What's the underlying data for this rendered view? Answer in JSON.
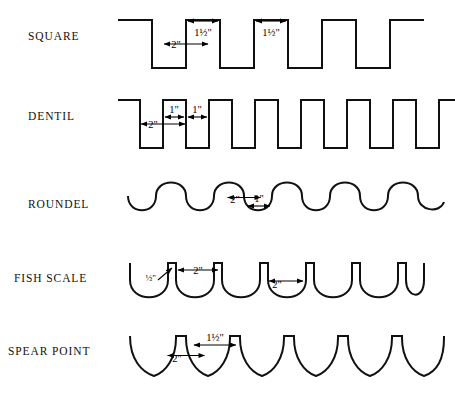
{
  "figure": {
    "background_color": "#ffffff",
    "line_color": "#111111",
    "width": 455,
    "height": 408,
    "type": "technical-profile-diagram"
  },
  "rows": [
    {
      "id": "square",
      "label": "SQUARE",
      "profile": "square-wave",
      "dimensions": [
        {
          "id": "square-depth",
          "value": "2\"",
          "orientation": "vertical",
          "meaning": "depth of cut"
        },
        {
          "id": "square-width-1",
          "value": "1½\"",
          "orientation": "horizontal",
          "meaning": "notch width"
        },
        {
          "id": "square-width-2",
          "value": "1½\"",
          "orientation": "horizontal",
          "meaning": "tooth width"
        }
      ]
    },
    {
      "id": "dentil",
      "label": "DENTIL",
      "profile": "square-wave-narrow",
      "dimensions": [
        {
          "id": "dentil-depth",
          "value": "2\"",
          "orientation": "vertical",
          "meaning": "depth of cut"
        },
        {
          "id": "dentil-width-1",
          "value": "1\"",
          "orientation": "horizontal",
          "meaning": "notch width"
        },
        {
          "id": "dentil-width-2",
          "value": "1\"",
          "orientation": "horizontal",
          "meaning": "tooth width"
        }
      ]
    },
    {
      "id": "roundel",
      "label": "ROUNDEL",
      "profile": "scalloped-wave",
      "dimensions": [
        {
          "id": "roundel-depth",
          "value": "2\"",
          "orientation": "vertical",
          "meaning": "depth of cut"
        },
        {
          "id": "roundel-width",
          "value": "1\"",
          "orientation": "horizontal",
          "meaning": "valley width"
        }
      ]
    },
    {
      "id": "fish-scale",
      "label": "FISH SCALE",
      "profile": "u-scallop",
      "dimensions": [
        {
          "id": "fish-scale-tip",
          "value": "½\"",
          "orientation": "leader",
          "meaning": "flat top width"
        },
        {
          "id": "fish-scale-width",
          "value": "2\"",
          "orientation": "horizontal",
          "meaning": "scallop width"
        },
        {
          "id": "fish-scale-depth",
          "value": "2\"",
          "orientation": "vertical",
          "meaning": "depth of cut"
        }
      ]
    },
    {
      "id": "spear-point",
      "label": "SPEAR POINT",
      "profile": "spear-point",
      "dimensions": [
        {
          "id": "spear-point-depth",
          "value": "2\"",
          "orientation": "vertical",
          "meaning": "depth of cut"
        },
        {
          "id": "spear-point-width",
          "value": "1½\"",
          "orientation": "horizontal",
          "meaning": "spacing between points"
        }
      ]
    }
  ]
}
